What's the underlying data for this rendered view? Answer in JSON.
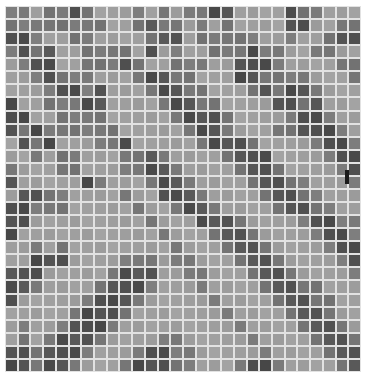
{
  "image": {
    "description": "Grayscale glass mosaic tile wall with diagonal bands of darker tiles",
    "grid": {
      "columns": 28,
      "rows": 28
    },
    "shades": [
      "#b8b8b8",
      "#9a9a9a",
      "#707070",
      "#454545"
    ],
    "rows": [
      "2212232111212122331111322111",
      "2222222211232212121111331122",
      "3321122111123312222211211233",
      "2323112222131211222322112211",
      "1233112223211222113332111122",
      "1123222111233221113322221112",
      "1112332311123322111232332111",
      "3112223311112332211113323111",
      "3311222211111233321111233211",
      "3232222221111123321112233321",
      "1323111223111112333211112332",
      "1121221112232111123331111233",
      "2111221112233211112332111123",
      "3111113211123321111233221112",
      "1332211112113332111123322111",
      "3322211111211233211112332211",
      "3311111111121113332111123322",
      "3111111111112111233211112332",
      "1121211111111211123321111233",
      "1133311112221221112332111123",
      "3331111123331122111233211112",
      "3321111233321112111123322111",
      "3111112333211111211112332211",
      "1111123332111111121111233211",
      "1211233321111111112111123321",
      "1212333211112211111211112332",
      "3323332111233221111121111233",
      "3323321112333221112332111123"
    ],
    "marker": {
      "present": true,
      "color": "#1a1a1a"
    }
  }
}
